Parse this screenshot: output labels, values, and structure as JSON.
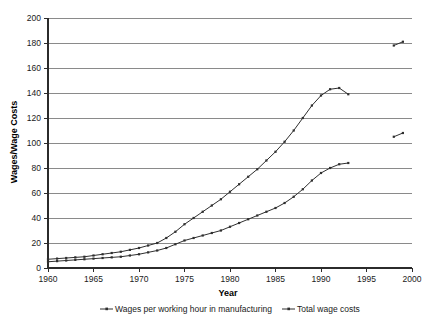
{
  "chart_data": {
    "type": "line",
    "title": "",
    "xlabel": "Year",
    "ylabel": "Wages/Wage Costs",
    "xlim": [
      1960,
      2000
    ],
    "ylim": [
      0,
      200
    ],
    "xticks": [
      1960,
      1965,
      1970,
      1975,
      1980,
      1985,
      1990,
      1995,
      2000
    ],
    "yticks": [
      0,
      20,
      40,
      60,
      80,
      100,
      120,
      140,
      160,
      180,
      200
    ],
    "grid": true,
    "legend_position": "bottom",
    "series": [
      {
        "name": "Wages per working hour in manufacturing",
        "marker": "line-dot",
        "segments": [
          {
            "x": [
              1960,
              1961,
              1962,
              1963,
              1964,
              1965,
              1966,
              1967,
              1968,
              1969,
              1970,
              1971,
              1972,
              1973,
              1974,
              1975,
              1976,
              1977,
              1978,
              1979,
              1980,
              1981,
              1982,
              1983,
              1984,
              1985,
              1986,
              1987,
              1988,
              1989,
              1990,
              1991,
              1992,
              1993
            ],
            "y": [
              5,
              5.5,
              6,
              6.5,
              7,
              7.5,
              8,
              8.5,
              9,
              10,
              11,
              12.5,
              14,
              16,
              19,
              22,
              24,
              26,
              28,
              30,
              33,
              36,
              39,
              42,
              45,
              48,
              52,
              57,
              63,
              70,
              76,
              80,
              83,
              84
            ]
          },
          {
            "x": [
              1998,
              1999
            ],
            "y": [
              105,
              108
            ]
          }
        ]
      },
      {
        "name": "Total wage costs",
        "marker": "line-dot",
        "segments": [
          {
            "x": [
              1960,
              1961,
              1962,
              1963,
              1964,
              1965,
              1966,
              1967,
              1968,
              1969,
              1970,
              1971,
              1972,
              1973,
              1974,
              1975,
              1976,
              1977,
              1978,
              1979,
              1980,
              1981,
              1982,
              1983,
              1984,
              1985,
              1986,
              1987,
              1988,
              1989,
              1990,
              1991,
              1992,
              1993
            ],
            "y": [
              7,
              7.5,
              8,
              8.5,
              9,
              10,
              11,
              12,
              13,
              14.5,
              16,
              18,
              20,
              24,
              29,
              35,
              40,
              45,
              50,
              55,
              61,
              67,
              73,
              79,
              86,
              93,
              101,
              110,
              120,
              130,
              138,
              143,
              144,
              139
            ]
          },
          {
            "x": [
              1998,
              1999
            ],
            "y": [
              178,
              181
            ]
          }
        ]
      }
    ]
  },
  "legend": {
    "items": [
      {
        "label": "Wages per working hour in manufacturing"
      },
      {
        "label": "Total wage costs"
      }
    ]
  },
  "axis": {
    "y_title": "Wages/Wage Costs",
    "x_title": "Year"
  }
}
